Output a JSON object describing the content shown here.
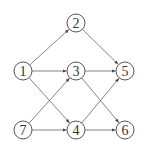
{
  "diagram": {
    "type": "directed-graph",
    "node_radius": 9,
    "nodes": [
      {
        "id": "1",
        "label": "1",
        "x": 23,
        "y": 71
      },
      {
        "id": "2",
        "label": "2",
        "x": 76,
        "y": 23
      },
      {
        "id": "3",
        "label": "3",
        "x": 76,
        "y": 71
      },
      {
        "id": "4",
        "label": "4",
        "x": 76,
        "y": 130
      },
      {
        "id": "5",
        "label": "5",
        "x": 125,
        "y": 71
      },
      {
        "id": "6",
        "label": "6",
        "x": 125,
        "y": 130
      },
      {
        "id": "7",
        "label": "7",
        "x": 23,
        "y": 130
      }
    ],
    "edges": [
      {
        "from": "1",
        "to": "2"
      },
      {
        "from": "1",
        "to": "3"
      },
      {
        "from": "1",
        "to": "4"
      },
      {
        "from": "2",
        "to": "5"
      },
      {
        "from": "3",
        "to": "5"
      },
      {
        "from": "3",
        "to": "6"
      },
      {
        "from": "4",
        "to": "5"
      },
      {
        "from": "4",
        "to": "6"
      },
      {
        "from": "7",
        "to": "3"
      },
      {
        "from": "7",
        "to": "4"
      }
    ],
    "colors": {
      "edge": "#666666",
      "node_stroke": "#555555",
      "label": "#333333"
    }
  }
}
